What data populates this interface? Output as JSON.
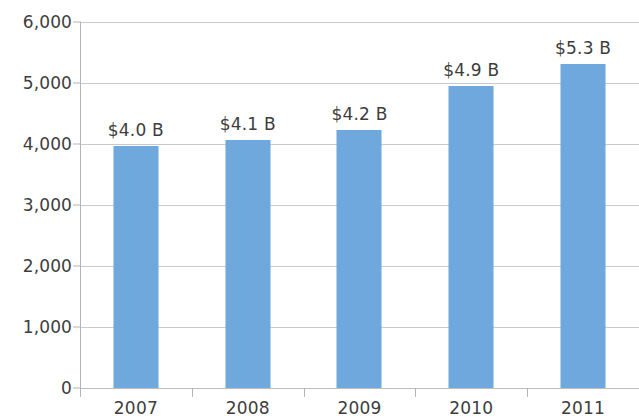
{
  "chart_data": {
    "type": "bar",
    "title": "",
    "subtitle": "",
    "xlabel": "",
    "ylabel": "",
    "categories": [
      "2007",
      "2008",
      "2009",
      "2010",
      "2011"
    ],
    "values": [
      3960,
      4060,
      4230,
      4950,
      5310
    ],
    "data_labels": [
      "$4.0 B",
      "$4.1 B",
      "$4.2 B",
      "$4.9 B",
      "$5.3 B"
    ],
    "ylim": [
      0,
      6000
    ],
    "ytick_values": [
      0,
      1000,
      2000,
      3000,
      4000,
      5000,
      6000
    ],
    "ytick_labels": [
      "0",
      "1,000",
      "2,000",
      "3,000",
      "4,000",
      "5,000",
      "6,000"
    ],
    "grid": true,
    "grid_axis": "y",
    "legend": false,
    "legend_position": "none",
    "series": [
      {
        "name": "Revenue",
        "values": [
          3960,
          4060,
          4230,
          4950,
          5310
        ],
        "color": "#6fa8dc"
      }
    ]
  },
  "style": {
    "bar_color": "#6fa8dc",
    "grid_color": "#c9c9c9",
    "axis_color": "#b4b4b4",
    "text_color": "#3d3d3d",
    "background": "#ffffff"
  }
}
